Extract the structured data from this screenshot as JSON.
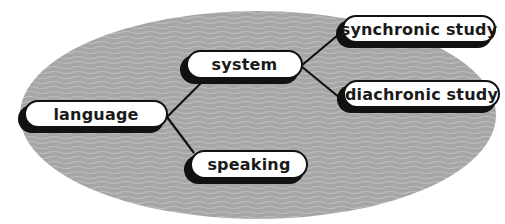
{
  "diagram": {
    "background": {
      "shape": "ellipse",
      "fill": "#a9a9a9",
      "texture": "wavy-lines"
    },
    "nodes": [
      {
        "id": "language",
        "label": "language"
      },
      {
        "id": "system",
        "label": "system"
      },
      {
        "id": "speaking",
        "label": "speaking"
      },
      {
        "id": "synchronic",
        "label": "synchronic study"
      },
      {
        "id": "diachronic",
        "label": "diachronic study"
      }
    ],
    "edges": [
      {
        "from": "language",
        "to": "system"
      },
      {
        "from": "language",
        "to": "speaking"
      },
      {
        "from": "system",
        "to": "synchronic"
      },
      {
        "from": "system",
        "to": "diachronic"
      }
    ]
  }
}
